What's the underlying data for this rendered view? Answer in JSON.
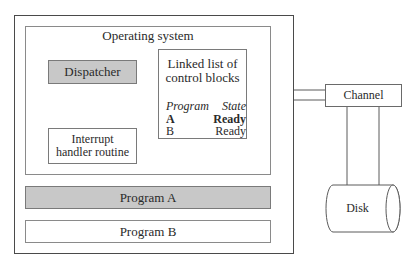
{
  "diagram": {
    "os_title": "Operating system",
    "dispatcher": "Dispatcher",
    "interrupt_handler": [
      "Interrupt",
      "handler routine"
    ],
    "linked_list": {
      "title_line1": "Linked list of",
      "title_line2": "control blocks",
      "columns": [
        "Program",
        "State"
      ],
      "rows": [
        {
          "program": "A",
          "state": "Ready",
          "bold": true
        },
        {
          "program": "B",
          "state": "Ready",
          "bold": false
        }
      ]
    },
    "program_a": "Program A",
    "program_b": "Program B",
    "channel": "Channel",
    "disk": "Disk"
  },
  "colors": {
    "shaded_fill": "#c8c8c8",
    "border": "#7a7a7a",
    "outer_border": "#4a4a4a"
  }
}
